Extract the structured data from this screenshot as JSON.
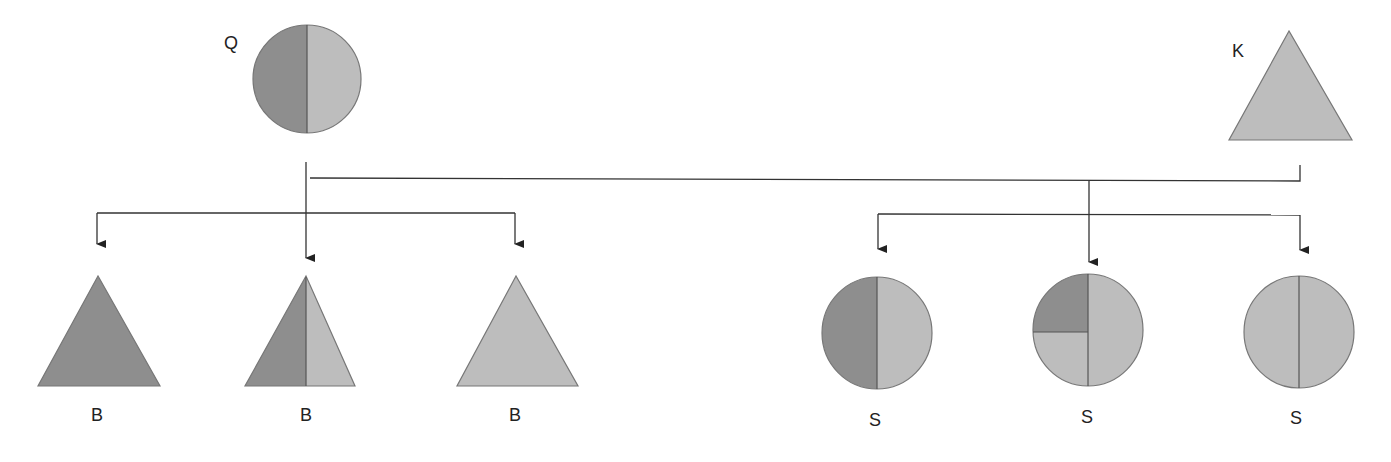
{
  "colors": {
    "dark": "#8e8e8e",
    "light": "#bdbdbd",
    "outline": "#666666",
    "line": "#333333"
  },
  "parents": [
    {
      "id": "Q",
      "label": "Q",
      "shape": "circle",
      "fill": "half-dark-half-light"
    },
    {
      "id": "K",
      "label": "K",
      "shape": "triangle",
      "fill": "all-light"
    }
  ],
  "offspring_left": [
    {
      "label": "B",
      "shape": "triangle",
      "fill": "all-dark"
    },
    {
      "label": "B",
      "shape": "triangle",
      "fill": "half-dark-half-light"
    },
    {
      "label": "B",
      "shape": "triangle",
      "fill": "all-light"
    }
  ],
  "offspring_right": [
    {
      "label": "S",
      "shape": "circle",
      "fill": "half-dark-half-light"
    },
    {
      "label": "S",
      "shape": "circle",
      "fill": "quarter-dark-three-quarters-light"
    },
    {
      "label": "S",
      "shape": "circle",
      "fill": "all-light"
    }
  ]
}
